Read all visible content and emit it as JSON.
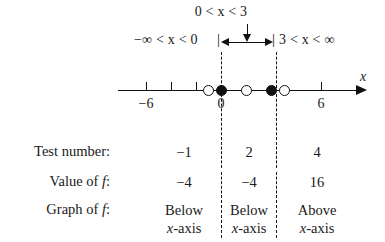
{
  "diagram": {
    "intervals": {
      "left_label": "−∞ < x < 0",
      "middle_label": "0 < x < 3",
      "right_label": "3 < x < ∞"
    },
    "axis": {
      "variable_label": "x",
      "tick_labels": [
        "−6",
        "0",
        "6"
      ],
      "tick_values": [
        -6,
        0,
        6
      ],
      "range": [
        -8,
        8
      ],
      "arrow_direction": "right"
    },
    "points": [
      {
        "x": -1,
        "style": "open"
      },
      {
        "x": 0,
        "style": "filled"
      },
      {
        "x": 2,
        "style": "open"
      },
      {
        "x": 3,
        "style": "filled"
      },
      {
        "x": 4,
        "style": "open"
      }
    ],
    "boundaries": [
      0,
      3
    ],
    "separator_glyph": "|"
  },
  "table": {
    "row_labels": {
      "test_number": "Test number:",
      "value_of_f_prefix": "Value of ",
      "value_of_f_italic": "f",
      "value_of_f_suffix": ":",
      "graph_of_f_prefix": "Graph of ",
      "graph_of_f_italic": "f",
      "graph_of_f_suffix": ":"
    },
    "columns": [
      {
        "interval": "−∞ < x < 0",
        "test_number": "−1",
        "value_of_f": "−4",
        "graph_line1": "Below",
        "graph_line2_italic": "x",
        "graph_line2_rest": "-axis"
      },
      {
        "interval": "0 < x < 3",
        "test_number": "2",
        "value_of_f": "−4",
        "graph_line1": "Below",
        "graph_line2_italic": "x",
        "graph_line2_rest": "-axis"
      },
      {
        "interval": "3 < x < ∞",
        "test_number": "4",
        "value_of_f": "16",
        "graph_line1": "Above",
        "graph_line2_italic": "x",
        "graph_line2_rest": "-axis"
      }
    ]
  },
  "colors": {
    "ink": "#1a1a1a",
    "line": "#111111",
    "background": "#ffffff"
  }
}
